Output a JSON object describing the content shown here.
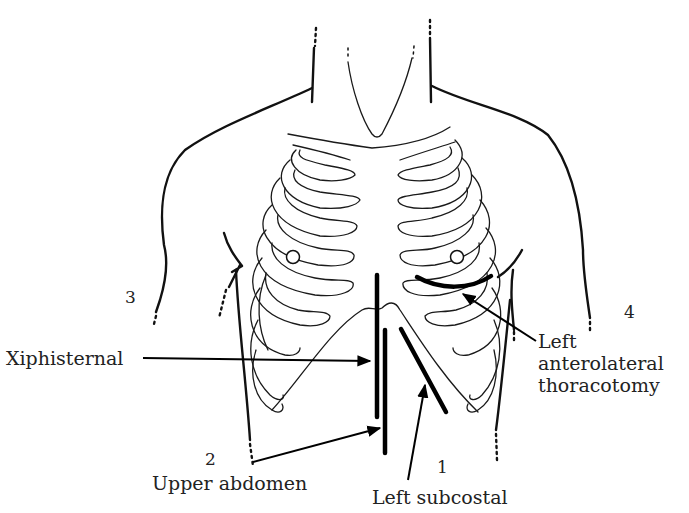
{
  "diagram": {
    "type": "anatomical-line-drawing",
    "colors": {
      "line": "#111111",
      "background": "#ffffff",
      "text": "#222222"
    },
    "incisions": [
      {
        "number": "1",
        "label": "Left subcostal"
      },
      {
        "number": "2",
        "label": "Upper abdomen"
      },
      {
        "number": "3",
        "label": ""
      },
      {
        "number": "4",
        "label": ""
      }
    ],
    "labels": {
      "xiphisternal": "Xiphisternal",
      "left_anterolateral_line1": "Left",
      "left_anterolateral_line2": "anterolateral",
      "left_anterolateral_line3": "thoracotomy",
      "upper_abdomen": "Upper abdomen",
      "left_subcostal": "Left subcostal"
    },
    "numbers": {
      "n1": "1",
      "n2": "2",
      "n3": "3",
      "n4": "4"
    }
  }
}
